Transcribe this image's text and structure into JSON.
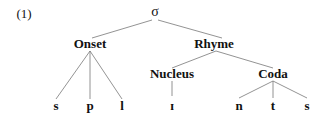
{
  "example_number": "(1)",
  "tree": {
    "root": "σ",
    "onset": {
      "label": "Onset",
      "children": [
        "s",
        "p",
        "l"
      ]
    },
    "rhyme": {
      "label": "Rhyme",
      "nucleus": {
        "label": "Nucleus",
        "children": [
          "ɪ"
        ]
      },
      "coda": {
        "label": "Coda",
        "children": [
          "n",
          "t",
          "s"
        ]
      }
    }
  },
  "colors": {
    "text": "#111111",
    "lines": "#777777"
  }
}
